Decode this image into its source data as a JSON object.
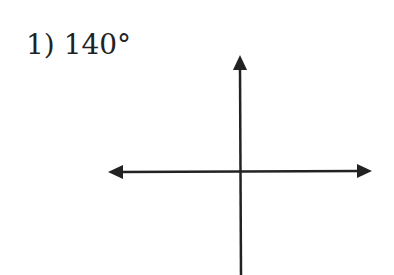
{
  "problem": {
    "label": "1) 140°",
    "number": "1)",
    "angle_degrees": 140
  },
  "diagram": {
    "type": "coordinate-axes",
    "stroke_color": "#222222",
    "arrows": [
      "up",
      "left",
      "right"
    ]
  }
}
